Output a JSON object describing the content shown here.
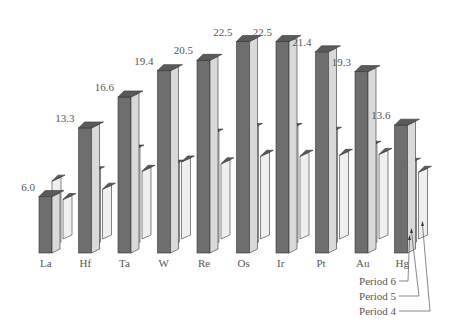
{
  "chart_data": {
    "type": "bar",
    "style": "3d-grouped",
    "title": "",
    "xlabel": "",
    "ylabel": "",
    "categories": [
      "La",
      "Hf",
      "Ta",
      "W",
      "Re",
      "Os",
      "Ir",
      "Pt",
      "Au",
      "Hg"
    ],
    "series": [
      {
        "name": "Period 6",
        "values": [
          6.0,
          13.3,
          16.6,
          19.4,
          20.5,
          22.5,
          22.5,
          21.4,
          19.3,
          13.6
        ],
        "labeled": true,
        "color": "#6e6e6e",
        "top_color": "#5a5a5a",
        "side_color": "#d9d9d9"
      },
      {
        "name": "Period 5",
        "values": [
          6.9,
          7.8,
          10.1,
          8.5,
          11.8,
          12.4,
          12.4,
          12.0,
          10.5,
          8.7
        ],
        "labeled": false,
        "color": "#dcdcdc",
        "top_color": "#5a5a5a",
        "side_color": "#efefef"
      },
      {
        "name": "Period 4",
        "values": [
          4.2,
          5.3,
          7.2,
          8.2,
          8.0,
          8.8,
          8.8,
          8.9,
          9.0,
          7.1
        ],
        "labeled": false,
        "color": "#dcdcdc",
        "top_color": "#5a5a5a",
        "side_color": "#efefef"
      }
    ],
    "value_labels": [
      "6.0",
      "13.3",
      "16.6",
      "19.4",
      "20.5",
      "22.5",
      "22.5",
      "21.4",
      "19.3",
      "13.6"
    ],
    "legend": {
      "position": "bottom-right",
      "entries": [
        "Period 6",
        "Period 5",
        "Period 4"
      ]
    },
    "grid": false,
    "axes_visible": false,
    "ylim": [
      0,
      24
    ]
  },
  "layout": {
    "first_x": 39,
    "spacing": 39.5,
    "baseline": 253,
    "px_per_unit": 9.4,
    "front_w": 13,
    "side_w": 8,
    "depth_dx": 4,
    "depth_dy": 4
  }
}
